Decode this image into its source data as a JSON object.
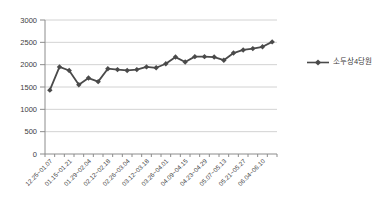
{
  "chart_data": {
    "type": "line",
    "title": "",
    "xlabel": "",
    "ylabel": "",
    "ylim": [
      0,
      3000
    ],
    "y_ticks": [
      0,
      500,
      1000,
      1500,
      2000,
      2500,
      3000
    ],
    "grid": "horizontal",
    "legend_position": "right",
    "label_every": 2,
    "x_tick_labels": [
      "12.25~01.07",
      "01.15~01.21",
      "01.29~02.04",
      "02.12~02.18",
      "02.26~03.04",
      "03.12~03.18",
      "03.26~04.01",
      "04.09~04.15",
      "04.23~04.29",
      "05.07~05.13",
      "05.21~05.27",
      "06.04~06.10"
    ],
    "series": [
      {
        "name": "소두상4당원",
        "marker": "diamond",
        "color": "#4a4a4a",
        "values": [
          1430,
          1950,
          1870,
          1550,
          1700,
          1620,
          1910,
          1890,
          1870,
          1890,
          1950,
          1930,
          2020,
          2170,
          2060,
          2180,
          2180,
          2170,
          2100,
          2260,
          2330,
          2360,
          2400,
          2510
        ]
      }
    ]
  },
  "colors": {
    "line": "#4a4a4a",
    "grid": "#c6c6c6",
    "axis": "#8c8c8c",
    "text": "#3d3d3d",
    "background": "#ffffff"
  }
}
